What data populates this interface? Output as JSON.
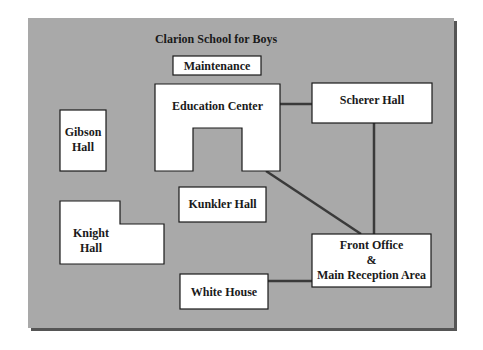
{
  "diagram": {
    "title": "Clarion School for Boys",
    "colors": {
      "page_background": "#ffffff",
      "panel_fill": "#a9a9a9",
      "panel_shadow": "#555555",
      "building_fill": "#ffffff",
      "outline": "#1a1a1a",
      "connector": "#3a3a3a"
    },
    "buildings": {
      "maintenance": {
        "label": "Maintenance"
      },
      "education_center": {
        "label": "Education Center"
      },
      "scherer_hall": {
        "label": "Scherer Hall"
      },
      "gibson_hall": {
        "line1": "Gibson",
        "line2": "Hall"
      },
      "kunkler_hall": {
        "label": "Kunkler Hall"
      },
      "knight_hall": {
        "line1": "Knight",
        "line2": "Hall"
      },
      "front_office": {
        "line1": "Front Office",
        "line2": "&",
        "line3": "Main Reception Area"
      },
      "white_house": {
        "label": "White House"
      }
    },
    "connections": [
      {
        "from": "Education Center",
        "to": "Scherer Hall"
      },
      {
        "from": "Education Center",
        "to": "Front Office & Main Reception Area"
      },
      {
        "from": "Scherer Hall",
        "to": "Front Office & Main Reception Area"
      },
      {
        "from": "White House",
        "to": "Front Office & Main Reception Area"
      }
    ]
  }
}
